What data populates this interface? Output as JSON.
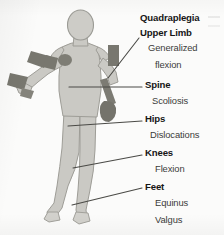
{
  "diagram": {
    "title": "Quadraplegia",
    "colors": {
      "background": "#fbfbfa",
      "body_fill": "#cac9c4",
      "body_stroke": "#9a9a94",
      "accent_dark": "#78776f",
      "accent_mid": "#8e8d85",
      "leader_line": "#4a4a46",
      "text": "#161616",
      "text_sub": "#3b3b3b"
    },
    "groups": [
      {
        "id": "quadraplegia",
        "header": "Quadraplegia",
        "items": [],
        "header_x": 140,
        "header_y": 18,
        "has_leader": false
      },
      {
        "id": "upper-limb",
        "header": "Upper Limb",
        "items": [
          "Generalized",
          "flexion"
        ],
        "header_x": 140,
        "header_y": 33,
        "has_leader": true
      },
      {
        "id": "spine",
        "header": "Spine",
        "items": [
          "Scoliosis"
        ],
        "header_x": 145,
        "header_y": 85,
        "has_leader": true
      },
      {
        "id": "hips",
        "header": "Hips",
        "items": [
          "Dislocations"
        ],
        "header_x": 145,
        "header_y": 119,
        "has_leader": true
      },
      {
        "id": "knees",
        "header": "Knees",
        "items": [
          "Flexion"
        ],
        "header_x": 145,
        "header_y": 152,
        "has_leader": true
      },
      {
        "id": "feet",
        "header": "Feet",
        "items": [
          "Equinus",
          "Valgus"
        ],
        "header_x": 145,
        "header_y": 186,
        "has_leader": true
      }
    ],
    "labels": {
      "quadraplegia": "Quadraplegia",
      "upper_limb": "Upper Limb",
      "upper_limb_item1": "Generalized",
      "upper_limb_item2": "flexion",
      "spine": "Spine",
      "spine_item1": "Scoliosis",
      "hips": "Hips",
      "hips_item1": "Dislocations",
      "knees": "Knees",
      "knees_item1": "Flexion",
      "feet": "Feet",
      "feet_item1": "Equinus",
      "feet_item2": "Valgus"
    }
  }
}
